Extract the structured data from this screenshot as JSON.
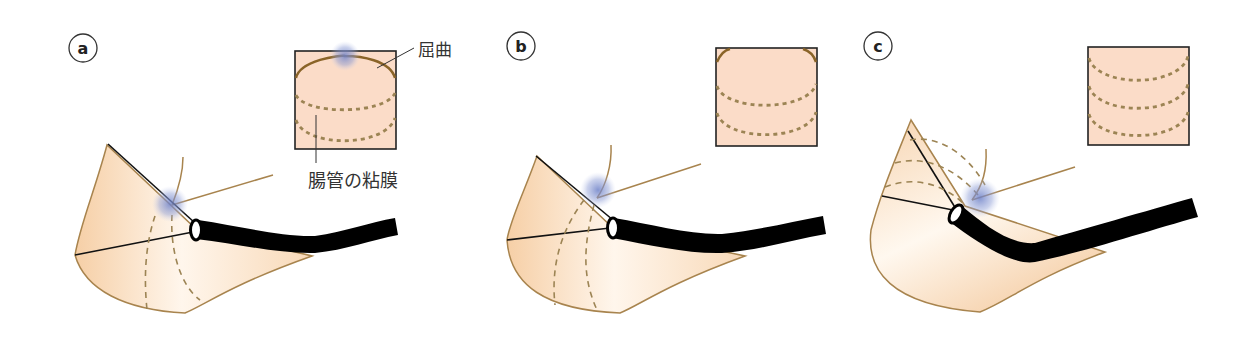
{
  "figure": {
    "panels": [
      {
        "id": "a",
        "label": "a"
      },
      {
        "id": "b",
        "label": "b"
      },
      {
        "id": "c",
        "label": "c"
      }
    ],
    "annotations": {
      "flexure": "屈曲",
      "intestinal_mucosa": "腸管の粘膜"
    },
    "colors": {
      "tissue_fill": "#fbe0c6",
      "tissue_outline": "#a8844e",
      "mucosa_dash": "#9c8454",
      "inset_fill": "#fbdcc8",
      "scope": "#000000",
      "contact_glow": "#6f82c8"
    }
  }
}
